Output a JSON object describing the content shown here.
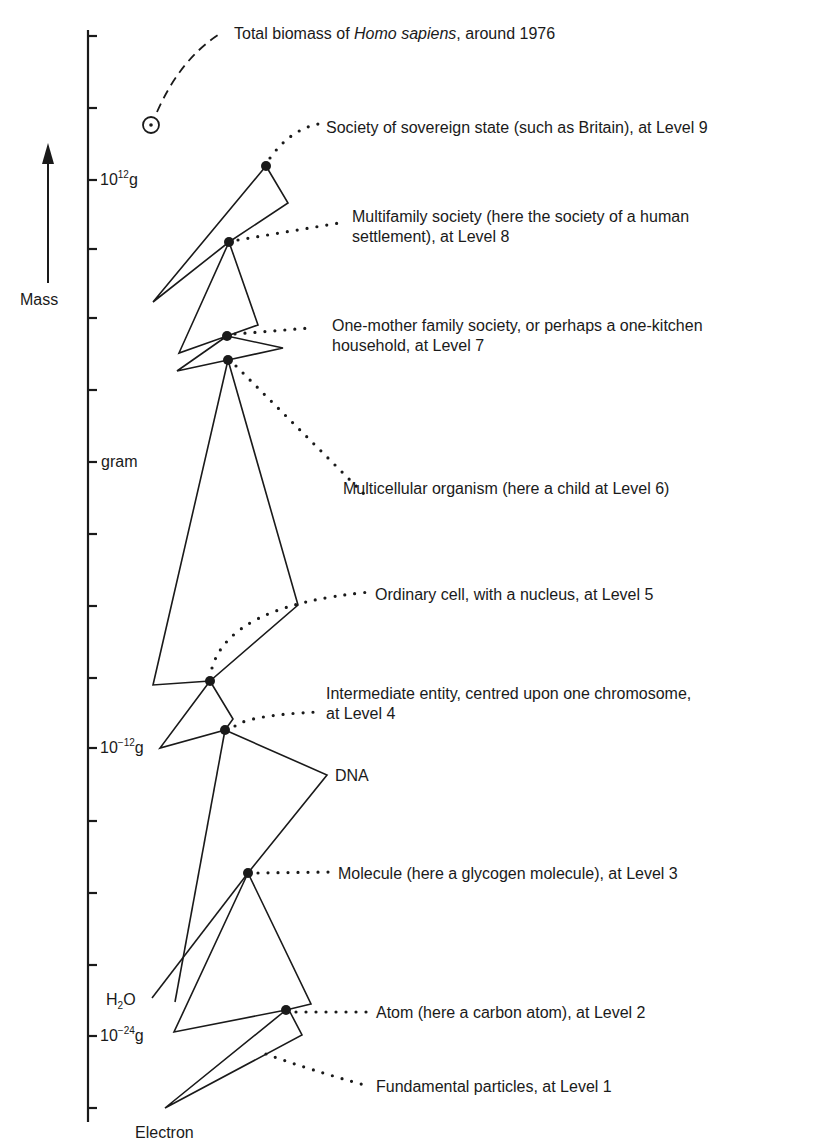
{
  "figure": {
    "axis": {
      "title": "Mass",
      "ticks": [
        {
          "label": "10",
          "sup": "12",
          "unit": "g"
        },
        {
          "label": "gram",
          "sup": "",
          "unit": ""
        },
        {
          "label": "10",
          "sup": "−12",
          "unit": "g"
        },
        {
          "label": "10",
          "sup": "−24",
          "unit": "g"
        }
      ]
    },
    "markers": {
      "h2o": {
        "main": "H",
        "sub": "2",
        "tail": "O"
      },
      "dna": "DNA",
      "electron": "Electron"
    },
    "annotations": {
      "biomass": {
        "pre": "Total biomass of ",
        "italic": "Homo sapiens",
        "post": ", around 1976"
      },
      "level9": "Society of sovereign state (such as Britain), at Level 9",
      "level8_line1": "Multifamily society (here the society of a human",
      "level8_line2": "settlement), at Level 8",
      "level7_line1": "One-mother family society, or perhaps a one-kitchen",
      "level7_line2": "household, at Level 7",
      "level6": "Multicellular organism (here a child at Level 6)",
      "level5": "Ordinary cell, with a nucleus, at Level 5",
      "level4_line1": "Intermediate entity, centred upon one chromosome,",
      "level4_line2": "at Level 4",
      "level3": "Molecule (here a glycogen molecule), at Level 3",
      "level2": "Atom (here a carbon atom), at Level 2",
      "level1": "Fundamental particles, at Level 1"
    },
    "colors": {
      "ink": "#1a1a1a",
      "background": "#ffffff"
    }
  }
}
